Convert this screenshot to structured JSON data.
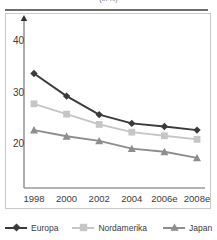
{
  "figure": {
    "title_truncated": "(in %)",
    "background_color": "#ffffff"
  },
  "axes": {
    "y_ticks": [
      "40",
      "30",
      "20"
    ],
    "x_ticks": [
      "1998",
      "2000",
      "2002",
      "2004",
      "2006e",
      "2008e"
    ]
  },
  "legend": {
    "items": [
      {
        "label": "Europa",
        "color": "#3a3a3a",
        "marker": "diamond"
      },
      {
        "label": "Nordamerika",
        "color": "#c6c6c6",
        "marker": "square"
      },
      {
        "label": "Japan",
        "color": "#8e8e8e",
        "marker": "triangle"
      }
    ]
  },
  "chart_data": {
    "type": "line",
    "title": "(in %)",
    "xlabel": "",
    "ylabel": "",
    "categories": [
      "1998",
      "2000",
      "2002",
      "2004",
      "2006e",
      "2008e"
    ],
    "x": [
      1998,
      2000,
      2002,
      2004,
      2006,
      2008
    ],
    "ylim": [
      13,
      42
    ],
    "yticks": [
      20,
      30,
      40
    ],
    "grid": false,
    "legend_position": "bottom",
    "series": [
      {
        "name": "Europa",
        "color": "#3a3a3a",
        "marker": "diamond",
        "values": [
          33.7,
          29.3,
          25.7,
          24.0,
          23.4,
          22.7
        ]
      },
      {
        "name": "Nordamerika",
        "color": "#c6c6c6",
        "marker": "square",
        "values": [
          27.8,
          25.8,
          23.8,
          22.3,
          21.6,
          20.9
        ]
      },
      {
        "name": "Japan",
        "color": "#8e8e8e",
        "marker": "triangle",
        "values": [
          22.7,
          21.5,
          20.6,
          19.1,
          18.5,
          17.3
        ]
      }
    ]
  }
}
